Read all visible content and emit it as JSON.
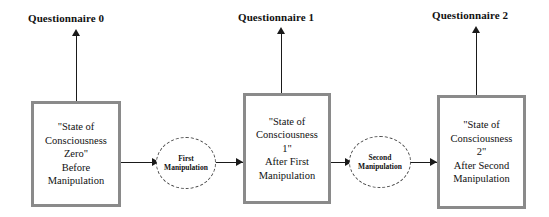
{
  "diagram": {
    "colors": {
      "box_border": "#8a8a8a",
      "ellipse_border": "#4a4a4a",
      "line": "#1a1a1a",
      "text": "#111111",
      "background": "#ffffff"
    },
    "headers": [
      {
        "id": "q0",
        "label": "Questionnaire 0"
      },
      {
        "id": "q1",
        "label": "Questionnaire 1"
      },
      {
        "id": "q2",
        "label": "Questionnaire 2"
      }
    ],
    "state_boxes": [
      {
        "id": "box0",
        "lines": [
          "\"State of",
          "Consciousness",
          "Zero\"",
          "Before",
          "Manipulation"
        ]
      },
      {
        "id": "box1",
        "lines": [
          "\"State of",
          "Consciousness",
          "1\"",
          "After First",
          "Manipulation"
        ]
      },
      {
        "id": "box2",
        "lines": [
          "\"State of",
          "Consciousness",
          "2\"",
          "After Second",
          "Manipulation"
        ]
      }
    ],
    "manipulations": [
      {
        "id": "m1",
        "lines": [
          "First",
          "Manipulation"
        ]
      },
      {
        "id": "m2",
        "lines": [
          "Second",
          "Manipulation"
        ]
      }
    ]
  }
}
